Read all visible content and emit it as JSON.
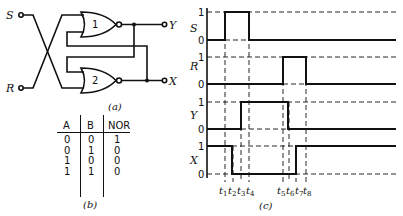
{
  "circuit": {
    "caption": "(a)",
    "inputs": [
      {
        "label": "S"
      },
      {
        "label": "R"
      }
    ],
    "outputs": [
      {
        "label": "Y"
      },
      {
        "label": "X"
      }
    ],
    "gates": [
      {
        "label": "1",
        "type": "NOR"
      },
      {
        "label": "2",
        "type": "NOR"
      }
    ]
  },
  "truth_table": {
    "caption": "(b)",
    "headers": [
      "A",
      "B",
      "NOR"
    ],
    "rows": [
      [
        "0",
        "0",
        "1"
      ],
      [
        "0",
        "1",
        "0"
      ],
      [
        "1",
        "0",
        "0"
      ],
      [
        "1",
        "1",
        "0"
      ]
    ]
  },
  "timing": {
    "caption": "(c)",
    "signals": [
      {
        "name": "S",
        "high": "1",
        "low": "0"
      },
      {
        "name": "R",
        "high": "1",
        "low": "0"
      },
      {
        "name": "Y",
        "high": "1",
        "low": "0"
      },
      {
        "name": "X",
        "high": "1",
        "low": "0"
      }
    ],
    "times": [
      "t",
      "t",
      "t",
      "t",
      "t",
      "t",
      "t",
      "t"
    ],
    "time_subs": [
      "1",
      "2",
      "3",
      "4",
      "5",
      "6",
      "7",
      "8"
    ]
  }
}
